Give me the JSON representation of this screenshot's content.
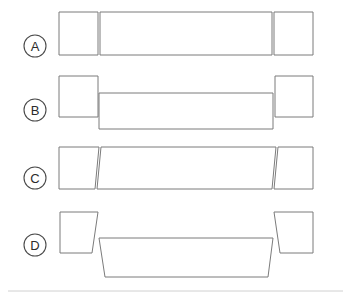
{
  "figure": {
    "background_color": "#ffffff",
    "stroke_color": "#7b7b7b",
    "label_stroke_color": "#4a4a4a",
    "label_text_color": "#2b2b2b",
    "rule_color": "#d0d0d0",
    "width": 349,
    "height": 298
  },
  "rows": [
    {
      "id": "row-a",
      "label": "A",
      "label_cx": 35,
      "label_cy": 46,
      "label_r": 11,
      "description": "Aligned flush members, no offset, no taper",
      "shapes": [
        {
          "name": "left-member",
          "points": "59,12 98,12 98,55 59,55"
        },
        {
          "name": "center-member",
          "points": "100,12 272,12 272,55 100,55"
        },
        {
          "name": "right-member",
          "points": "274,12 313,12 313,55 274,55"
        }
      ]
    },
    {
      "id": "row-b",
      "label": "B",
      "label_cx": 35,
      "label_cy": 110,
      "label_r": 11,
      "description": "Center member offset downward, ends flush and level",
      "shapes": [
        {
          "name": "left-member",
          "points": "59,76 98,76 98,117 59,117"
        },
        {
          "name": "center-member",
          "points": "99,93 273,93 273,129 99,129"
        },
        {
          "name": "right-member",
          "points": "275,76 313,76 313,117 275,117"
        }
      ]
    },
    {
      "id": "row-c",
      "label": "C",
      "label_cx": 35,
      "label_cy": 178,
      "label_r": 11,
      "description": "Slightly tapered members, angular misalignment at both joints",
      "shapes": [
        {
          "name": "left-member",
          "points": "59,147 99,147 95,189 59,189"
        },
        {
          "name": "center-member",
          "points": "101,147 276,147 272,189 97,189"
        },
        {
          "name": "right-member",
          "points": "278,147 313,147 313,189 274,189"
        }
      ]
    },
    {
      "id": "row-d",
      "label": "D",
      "label_cx": 35,
      "label_cy": 245,
      "label_r": 11,
      "description": "Strong angular misalignment, center member dropped and splayed",
      "shapes": [
        {
          "name": "left-member",
          "points": "60,212 98,212 92,253 60,253"
        },
        {
          "name": "center-member",
          "points": "99,238 273,238 268,277 105,277"
        },
        {
          "name": "right-member",
          "points": "274,212 313,212 313,253 280,253"
        }
      ]
    }
  ],
  "footer": {
    "rule_x1": 8,
    "rule_x2": 343,
    "rule_y": 291
  }
}
